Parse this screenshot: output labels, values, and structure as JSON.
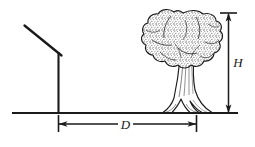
{
  "figure": {
    "background_color": "#ffffff",
    "ink_color": "#1a1a1a",
    "width": 255,
    "height": 147
  },
  "labels": {
    "height_label": "H",
    "distance_label": "D"
  },
  "elements": {
    "ground_line": "ground-line",
    "pole": "vertical-pole",
    "sight_arm": "slanted-sighting-arm",
    "tree_canopy": "tree-canopy",
    "tree_trunk": "tree-trunk",
    "tree_roots": "tree-root-flare",
    "height_arrow": "height-dimension-arrow",
    "distance_arrow": "distance-dimension-arrow"
  },
  "geometry": {
    "ground_y": 113,
    "ground_x_start": 12,
    "ground_x_end": 238,
    "pole_x": 58,
    "pole_top_y": 52,
    "sight_arm_start_x": 25,
    "sight_arm_start_y": 26,
    "sight_arm_end_x": 61,
    "sight_arm_end_y": 55,
    "canopy_center_x": 183,
    "canopy_center_y": 48,
    "canopy_top_y": 12,
    "canopy_left_x": 143,
    "canopy_right_x": 222,
    "trunk_center_x": 188,
    "height_arrow_x": 228,
    "height_arrow_top_y": 13,
    "height_arrow_bottom_y": 113,
    "distance_arrow_y": 124,
    "distance_arrow_left_x": 58,
    "distance_arrow_right_x": 196
  },
  "icons": {
    "arrow_up": "arrow-up-icon",
    "arrow_down": "arrow-down-icon",
    "arrow_left": "arrow-left-icon",
    "arrow_right": "arrow-right-icon"
  }
}
